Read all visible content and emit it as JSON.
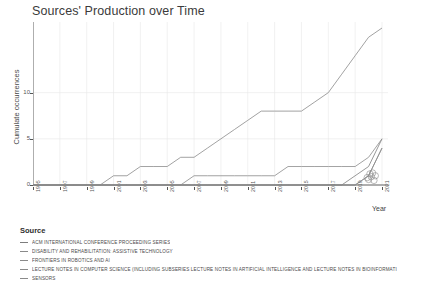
{
  "chart": {
    "title": "Sources' Production over Time",
    "xlabel": "Year",
    "ylabel": "Cumulate occurrences"
  },
  "legend": {
    "title": "Source",
    "items": [
      {
        "label": "ACM INTERNATIONAL CONFERENCE PROCEEDING SERIES",
        "color": "#7d7d7d"
      },
      {
        "label": "DISABILITY AND REHABILITATION: ASSISTIVE TECHNOLOGY",
        "color": "#8a8a8a"
      },
      {
        "label": "FRONTIERS IN ROBOTICS AND AI",
        "color": "#8a8a8a"
      },
      {
        "label": "LECTURE NOTES IN COMPUTER SCIENCE (INCLUDING SUBSERIES LECTURE NOTES IN ARTIFICIAL INTELLIGENCE AND LECTURE NOTES IN BIOINFORMATI",
        "color": "#8a8a8a"
      },
      {
        "label": "SENSORS",
        "color": "#8a8a8a"
      }
    ]
  },
  "chart_data": {
    "type": "line",
    "title": "Sources' Production over Time",
    "xlabel": "Year",
    "ylabel": "Cumulate occurrences",
    "x": [
      1995,
      1996,
      1997,
      1998,
      1999,
      2000,
      2001,
      2002,
      2003,
      2004,
      2005,
      2006,
      2007,
      2008,
      2009,
      2010,
      2011,
      2012,
      2013,
      2014,
      2015,
      2016,
      2017,
      2018,
      2019,
      2020,
      2021
    ],
    "xlim": [
      1995,
      2021
    ],
    "ylim": [
      0,
      17
    ],
    "yticks": [
      0,
      5,
      10
    ],
    "xticks": [
      1995,
      1997,
      1999,
      2001,
      2003,
      2005,
      2007,
      2009,
      2011,
      2013,
      2015,
      2017,
      2019,
      2021
    ],
    "grid": true,
    "legend_position": "below",
    "series": [
      {
        "name": "ACM INTERNATIONAL CONFERENCE PROCEEDING SERIES",
        "color": "#7d7d7d",
        "values": [
          0,
          0,
          0,
          0,
          0,
          0,
          0,
          0,
          0,
          0,
          0,
          0,
          0,
          0,
          0,
          0,
          0,
          0,
          0,
          0,
          0,
          0,
          0,
          0,
          1,
          2,
          5
        ]
      },
      {
        "name": "DISABILITY AND REHABILITATION: ASSISTIVE TECHNOLOGY",
        "color": "#8a8a8a",
        "values": [
          0,
          0,
          0,
          0,
          0,
          0,
          0,
          0,
          0,
          0,
          0,
          0,
          1,
          1,
          1,
          1,
          1,
          1,
          1,
          2,
          2,
          2,
          2,
          2,
          2,
          3,
          5
        ]
      },
      {
        "name": "FRONTIERS IN ROBOTICS AND AI",
        "color": "#8a8a8a",
        "values": [
          0,
          0,
          0,
          0,
          0,
          0,
          0,
          0,
          0,
          0,
          0,
          0,
          0,
          0,
          0,
          0,
          0,
          0,
          0,
          0,
          0,
          0,
          0,
          0,
          0,
          1,
          4
        ]
      },
      {
        "name": "LECTURE NOTES IN COMPUTER SCIENCE (INCLUDING SUBSERIES LECTURE NOTES IN ARTIFICIAL INTELLIGENCE AND LECTURE NOTES IN BIOINFORMATI",
        "color": "#8a8a8a",
        "values": [
          0,
          0,
          0,
          0,
          0,
          0,
          1,
          1,
          2,
          2,
          2,
          3,
          3,
          4,
          5,
          6,
          7,
          8,
          8,
          8,
          8,
          9,
          10,
          12,
          14,
          16,
          17
        ]
      },
      {
        "name": "SENSORS",
        "color": "#8a8a8a",
        "values": [
          0,
          0,
          0,
          0,
          0,
          0,
          0,
          0,
          0,
          0,
          0,
          0,
          0,
          0,
          0,
          0,
          0,
          0,
          0,
          0,
          0,
          0,
          0,
          0,
          0,
          1,
          4
        ]
      }
    ]
  }
}
